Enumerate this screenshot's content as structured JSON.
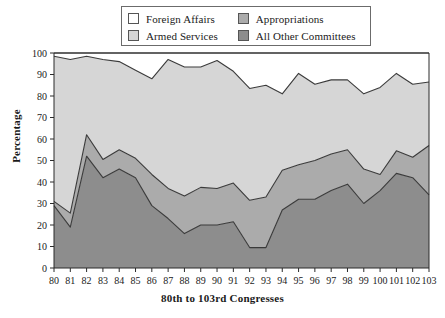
{
  "chart_data": {
    "type": "area",
    "stacked": true,
    "title": "",
    "xlabel": "80th to 103rd Congresses",
    "ylabel": "Percentage",
    "ylim": [
      0,
      100
    ],
    "yticks": [
      0,
      10,
      20,
      30,
      40,
      50,
      60,
      70,
      80,
      90,
      100
    ],
    "grid": false,
    "legend_position": "top-center",
    "categories": [
      "80",
      "81",
      "82",
      "83",
      "84",
      "85",
      "86",
      "87",
      "88",
      "89",
      "90",
      "91",
      "92",
      "93",
      "94",
      "95",
      "96",
      "97",
      "98",
      "99",
      "100",
      "101",
      "102",
      "103"
    ],
    "series": [
      {
        "name": "All Other Committees",
        "color": "#8d8d8d",
        "values": [
          29,
          19,
          52,
          42,
          46,
          42,
          29,
          23,
          16,
          20,
          20,
          21.5,
          9.5,
          9.5,
          27,
          32,
          32,
          36,
          39,
          30,
          36,
          44,
          42,
          34
        ]
      },
      {
        "name": "Appropriations",
        "color": "#ababab",
        "values": [
          2,
          6.5,
          10,
          8.5,
          9,
          9,
          14.5,
          14,
          17.5,
          17.5,
          17,
          18,
          22,
          23.5,
          18.5,
          16,
          18,
          17,
          16,
          16,
          7.5,
          10.5,
          9.5,
          23
        ]
      },
      {
        "name": "Armed Services",
        "color": "#d6d6d6",
        "values": [
          67.5,
          71.5,
          36.5,
          46.5,
          41,
          41,
          44.5,
          60,
          60,
          56,
          59.5,
          52,
          52,
          52,
          35.5,
          42.5,
          35.5,
          34.5,
          32.5,
          35,
          40.5,
          36,
          34,
          29.5
        ]
      },
      {
        "name": "Foreign Affairs",
        "color": "#ffffff",
        "values": [
          1.5,
          3,
          1.5,
          3,
          4,
          8,
          12,
          3,
          6.5,
          6.5,
          3.5,
          8.5,
          16.5,
          15,
          19,
          9.5,
          14.5,
          12.5,
          12.5,
          19,
          16,
          9.5,
          14.5,
          13.5
        ]
      }
    ],
    "cumulative": {
      "all_other_committees": [
        29,
        19,
        52,
        42,
        46,
        42,
        29,
        23,
        16,
        20,
        20,
        21.5,
        9.5,
        9.5,
        27,
        32,
        32,
        36,
        39,
        30,
        36,
        44,
        42,
        34
      ],
      "plus_appropriations": [
        31,
        25.5,
        62,
        50.5,
        55,
        51,
        43.5,
        37,
        33.5,
        37.5,
        37,
        39.5,
        31.5,
        33,
        45.5,
        48,
        50,
        53,
        55,
        46,
        43.5,
        54.5,
        51.5,
        57
      ],
      "plus_armed_services": [
        98.5,
        97,
        98.5,
        97,
        96,
        92,
        88,
        97,
        93.5,
        93.5,
        96.5,
        91.5,
        83.5,
        85,
        81,
        90.5,
        85.5,
        87.5,
        87.5,
        81,
        84,
        90.5,
        85.5,
        86.5
      ]
    }
  },
  "legend": {
    "items": [
      {
        "label": "Foreign Affairs",
        "color": "#ffffff"
      },
      {
        "label": "Appropriations",
        "color": "#ababab"
      },
      {
        "label": "Armed Services",
        "color": "#d6d6d6"
      },
      {
        "label": "All Other Committees",
        "color": "#8d8d8d"
      }
    ]
  },
  "axes": {
    "y_title": "Percentage",
    "x_title": "80th to 103rd Congresses"
  }
}
